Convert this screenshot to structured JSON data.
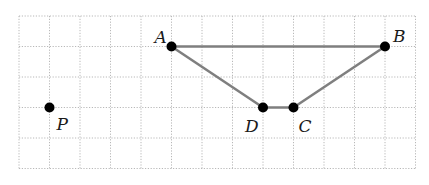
{
  "figure": {
    "type": "geometry-grid",
    "grid": {
      "origin_x": 19,
      "origin_y": 16,
      "cell": 30.5,
      "columns": 13,
      "rows": 5,
      "line_color": "#b8b8b8",
      "style": "dotted"
    },
    "points": [
      {
        "id": "A",
        "label": "A",
        "gx": 5,
        "gy": 1,
        "label_dx": -17,
        "label_dy": -4
      },
      {
        "id": "B",
        "label": "B",
        "gx": 12,
        "gy": 1,
        "label_dx": 8,
        "label_dy": -5
      },
      {
        "id": "C",
        "label": "C",
        "gx": 9,
        "gy": 3,
        "label_dx": 5,
        "label_dy": 24
      },
      {
        "id": "D",
        "label": "D",
        "gx": 8,
        "gy": 3,
        "label_dx": -18,
        "label_dy": 24
      },
      {
        "id": "P",
        "label": "P",
        "gx": 1,
        "gy": 3,
        "label_dx": 7,
        "label_dy": 22
      }
    ],
    "segments": [
      {
        "from": "A",
        "to": "B"
      },
      {
        "from": "B",
        "to": "C"
      },
      {
        "from": "C",
        "to": "D"
      },
      {
        "from": "D",
        "to": "A"
      }
    ],
    "segment_color": "#7f7f7f",
    "point_color": "#000000"
  }
}
